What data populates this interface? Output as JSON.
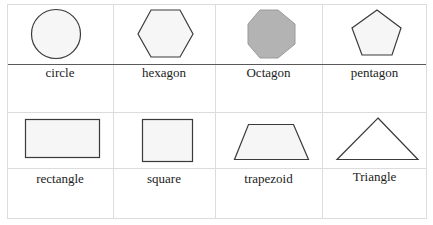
{
  "table": {
    "rows": [
      {
        "cells": [
          {
            "shape": "circle",
            "label": "circle"
          },
          {
            "shape": "hexagon",
            "label": "hexagon"
          },
          {
            "shape": "octagon",
            "label": "Octagon"
          },
          {
            "shape": "pentagon",
            "label": "pentagon"
          }
        ]
      },
      {
        "cells": [
          {
            "shape": "rectangle",
            "label": "rectangle"
          },
          {
            "shape": "square",
            "label": "square"
          },
          {
            "shape": "trapezoid",
            "label": "trapezoid"
          },
          {
            "shape": "triangle",
            "label": "Triangle"
          }
        ]
      }
    ]
  },
  "colors": {
    "shape_stroke": "#3a3a3a",
    "shape_fill": "#f6f6f6",
    "octagon_fill": "#b3b3b3",
    "octagon_stroke": "#9a9a9a",
    "grid_line": "#dcdcdc",
    "divider_dark": "#5a5a5a"
  }
}
